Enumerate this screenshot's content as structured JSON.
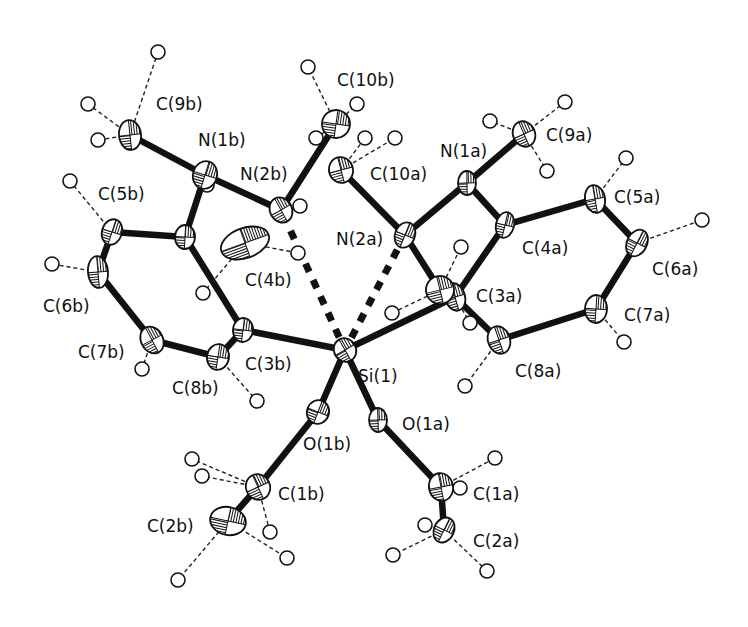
{
  "figure": {
    "type": "ORTEP molecular structure",
    "central_atom": "Si(1)",
    "background": "#ffffff",
    "ink": "#111111"
  },
  "atoms": [
    {
      "id": "Si1",
      "label": "Si(1)",
      "x": 345,
      "y": 350,
      "rx": 11,
      "ry": 12,
      "lx": 358,
      "ly": 382
    },
    {
      "id": "C3b",
      "label": "C(3b)",
      "x": 243,
      "y": 330,
      "rx": 10,
      "ry": 12,
      "lx": 245,
      "ly": 370
    },
    {
      "id": "C3a",
      "label": "C(3a)",
      "x": 455,
      "y": 297,
      "rx": 10,
      "ry": 14,
      "lx": 476,
      "ly": 302
    },
    {
      "id": "O1b",
      "label": "O(1b)",
      "x": 318,
      "y": 412,
      "rx": 11,
      "ry": 12,
      "lx": 303,
      "ly": 450
    },
    {
      "id": "O1a",
      "label": "O(1a)",
      "x": 378,
      "y": 420,
      "rx": 9,
      "ry": 12,
      "lx": 402,
      "ly": 430
    },
    {
      "id": "C1b",
      "label": "C(1b)",
      "x": 258,
      "y": 487,
      "rx": 12,
      "ry": 13,
      "lx": 278,
      "ly": 500
    },
    {
      "id": "C2b",
      "label": "C(2b)",
      "x": 228,
      "y": 521,
      "rx": 18,
      "ry": 14,
      "lx": 147,
      "ly": 532
    },
    {
      "id": "C1a",
      "label": "C(1a)",
      "x": 441,
      "y": 487,
      "rx": 12,
      "ry": 14,
      "lx": 473,
      "ly": 500
    },
    {
      "id": "C2a",
      "label": "C(2a)",
      "x": 444,
      "y": 530,
      "rx": 10,
      "ry": 13,
      "lx": 473,
      "ly": 547
    },
    {
      "id": "C4b_ring",
      "label": "",
      "x": 185,
      "y": 237,
      "rx": 10,
      "ry": 12,
      "lx": 0,
      "ly": 0
    },
    {
      "id": "C4b",
      "label": "C(4b)",
      "x": 245,
      "y": 243,
      "rx": 25,
      "ry": 15,
      "lx": 245,
      "ly": 286
    },
    {
      "id": "N1b",
      "label": "N(1b)",
      "x": 205,
      "y": 175,
      "rx": 12,
      "ry": 14,
      "lx": 198,
      "ly": 146
    },
    {
      "id": "C9b",
      "label": "C(9b)",
      "x": 130,
      "y": 135,
      "rx": 11,
      "ry": 15,
      "lx": 156,
      "ly": 110
    },
    {
      "id": "N2b",
      "label": "N(2b)",
      "x": 281,
      "y": 210,
      "rx": 11,
      "ry": 13,
      "lx": 240,
      "ly": 180
    },
    {
      "id": "C10b",
      "label": "C(10b)",
      "x": 336,
      "y": 124,
      "rx": 14,
      "ry": 14,
      "lx": 337,
      "ly": 86
    },
    {
      "id": "C10a",
      "label": "C(10a)",
      "x": 341,
      "y": 170,
      "rx": 12,
      "ry": 13,
      "lx": 370,
      "ly": 180
    },
    {
      "id": "N2a",
      "label": "N(2a)",
      "x": 405,
      "y": 235,
      "rx": 10,
      "ry": 13,
      "lx": 336,
      "ly": 245
    },
    {
      "id": "N1a",
      "label": "N(1a)",
      "x": 467,
      "y": 183,
      "rx": 9,
      "ry": 12,
      "lx": 440,
      "ly": 157
    },
    {
      "id": "C9a",
      "label": "C(9a)",
      "x": 524,
      "y": 134,
      "rx": 11,
      "ry": 13,
      "lx": 546,
      "ly": 141
    },
    {
      "id": "C4a",
      "label": "C(4a)",
      "x": 505,
      "y": 225,
      "rx": 9,
      "ry": 13,
      "lx": 522,
      "ly": 254
    },
    {
      "id": "C5a",
      "label": "C(5a)",
      "x": 595,
      "y": 199,
      "rx": 10,
      "ry": 14,
      "lx": 614,
      "ly": 203
    },
    {
      "id": "C6a",
      "label": "C(6a)",
      "x": 637,
      "y": 243,
      "rx": 10,
      "ry": 14,
      "lx": 652,
      "ly": 275
    },
    {
      "id": "C7a",
      "label": "C(7a)",
      "x": 596,
      "y": 309,
      "rx": 11,
      "ry": 14,
      "lx": 624,
      "ly": 321
    },
    {
      "id": "C8a",
      "label": "C(8a)",
      "x": 499,
      "y": 340,
      "rx": 11,
      "ry": 14,
      "lx": 515,
      "ly": 377
    },
    {
      "id": "C5b",
      "label": "C(5b)",
      "x": 112,
      "y": 232,
      "rx": 10,
      "ry": 13,
      "lx": 98,
      "ly": 200
    },
    {
      "id": "C6b",
      "label": "C(6b)",
      "x": 98,
      "y": 272,
      "rx": 10,
      "ry": 16,
      "lx": 43,
      "ly": 312
    },
    {
      "id": "C7b",
      "label": "C(7b)",
      "x": 152,
      "y": 340,
      "rx": 11,
      "ry": 14,
      "lx": 78,
      "ly": 358
    },
    {
      "id": "C8b",
      "label": "C(8b)",
      "x": 218,
      "y": 357,
      "rx": 11,
      "ry": 13,
      "lx": 172,
      "ly": 394
    },
    {
      "id": "C3a_neighbor",
      "label": "",
      "x": 440,
      "y": 290,
      "rx": 14,
      "ry": 14,
      "lx": 0,
      "ly": 0
    }
  ],
  "bonds": [
    [
      "Si1",
      "C3b"
    ],
    [
      "Si1",
      "C3a"
    ],
    [
      "Si1",
      "O1b"
    ],
    [
      "Si1",
      "O1a"
    ],
    [
      "O1b",
      "C1b"
    ],
    [
      "C1b",
      "C2b"
    ],
    [
      "O1a",
      "C1a"
    ],
    [
      "C1a",
      "C2a"
    ],
    [
      "C3b",
      "C8b"
    ],
    [
      "C8b",
      "C7b"
    ],
    [
      "C7b",
      "C6b"
    ],
    [
      "C6b",
      "C5b"
    ],
    [
      "C5b",
      "C4b_ring"
    ],
    [
      "C4b_ring",
      "C3b"
    ],
    [
      "C4b_ring",
      "N1b"
    ],
    [
      "N1b",
      "C9b"
    ],
    [
      "N1b",
      "N2b"
    ],
    [
      "N2b",
      "C10b"
    ],
    [
      "C3a",
      "C4a"
    ],
    [
      "C4a",
      "C5a"
    ],
    [
      "C5a",
      "C6a"
    ],
    [
      "C6a",
      "C7a"
    ],
    [
      "C7a",
      "C8a"
    ],
    [
      "C8a",
      "C3a"
    ],
    [
      "C4a",
      "N1a"
    ],
    [
      "N1a",
      "C9a"
    ],
    [
      "N1a",
      "N2a"
    ],
    [
      "N2a",
      "C10a"
    ],
    [
      "N2a",
      "C3a_neighbor"
    ]
  ],
  "coordination_bonds": [
    [
      "Si1",
      "N2b"
    ],
    [
      "Si1",
      "N2a"
    ]
  ],
  "hydrogens": [
    {
      "x": 158,
      "y": 52,
      "parent": "C9b"
    },
    {
      "x": 88,
      "y": 104,
      "parent": "C9b"
    },
    {
      "x": 98,
      "y": 140,
      "parent": "C9b"
    },
    {
      "x": 308,
      "y": 67,
      "parent": "C10b"
    },
    {
      "x": 357,
      "y": 104,
      "parent": "C10b"
    },
    {
      "x": 316,
      "y": 138,
      "parent": "C10b"
    },
    {
      "x": 365,
      "y": 138,
      "parent": "C10a"
    },
    {
      "x": 395,
      "y": 138,
      "parent": "C10a"
    },
    {
      "x": 300,
      "y": 206,
      "parent": "N2b"
    },
    {
      "x": 490,
      "y": 121,
      "parent": "C9a"
    },
    {
      "x": 565,
      "y": 102,
      "parent": "C9a"
    },
    {
      "x": 547,
      "y": 171,
      "parent": "C9a"
    },
    {
      "x": 626,
      "y": 158,
      "parent": "C5a"
    },
    {
      "x": 702,
      "y": 220,
      "parent": "C6a"
    },
    {
      "x": 624,
      "y": 342,
      "parent": "C7a"
    },
    {
      "x": 465,
      "y": 386,
      "parent": "C8a"
    },
    {
      "x": 461,
      "y": 247,
      "parent": "C3a_neighbor"
    },
    {
      "x": 392,
      "y": 313,
      "parent": "C3a_neighbor"
    },
    {
      "x": 470,
      "y": 323,
      "parent": "C3a"
    },
    {
      "x": 70,
      "y": 181,
      "parent": "C5b"
    },
    {
      "x": 52,
      "y": 264,
      "parent": "C6b"
    },
    {
      "x": 142,
      "y": 369,
      "parent": "C7b"
    },
    {
      "x": 257,
      "y": 401,
      "parent": "C8b"
    },
    {
      "x": 203,
      "y": 293,
      "parent": "C4b"
    },
    {
      "x": 298,
      "y": 253,
      "parent": "C4b"
    },
    {
      "x": 207,
      "y": 185,
      "parent": "N1b"
    },
    {
      "x": 192,
      "y": 459,
      "parent": "C1b"
    },
    {
      "x": 202,
      "y": 476,
      "parent": "C1b"
    },
    {
      "x": 270,
      "y": 532,
      "parent": "C1b"
    },
    {
      "x": 287,
      "y": 558,
      "parent": "C2b"
    },
    {
      "x": 178,
      "y": 580,
      "parent": "C2b"
    },
    {
      "x": 495,
      "y": 458,
      "parent": "C1a"
    },
    {
      "x": 425,
      "y": 525,
      "parent": "C2a"
    },
    {
      "x": 393,
      "y": 555,
      "parent": "C2a"
    },
    {
      "x": 487,
      "y": 571,
      "parent": "C2a"
    },
    {
      "x": 460,
      "y": 488,
      "parent": "C1a"
    }
  ]
}
